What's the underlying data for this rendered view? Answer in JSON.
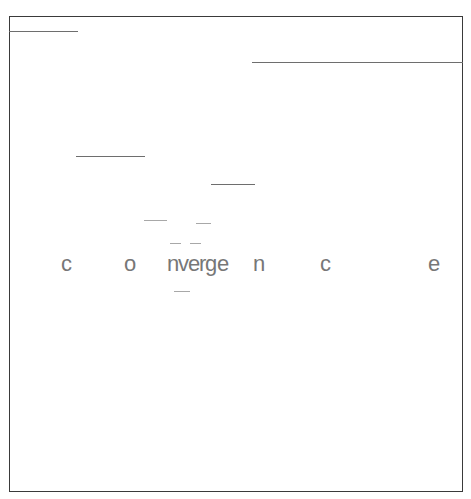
{
  "artwork": {
    "title": "convergence",
    "word": "convergence",
    "background_color": "#ffffff",
    "frame_color": "#3a3a3a",
    "line_color": "#8d8d8d",
    "text_color": "#777777"
  },
  "frame": {
    "label": "picture-frame-border",
    "x": 9,
    "y": 16,
    "width": 454,
    "height": 476
  },
  "lines": [
    {
      "label": "rule-1",
      "x": 9,
      "y": 31,
      "length": 69,
      "weight": "heavy"
    },
    {
      "label": "rule-2",
      "x": 252,
      "y": 62,
      "length": 211,
      "weight": "heavy"
    },
    {
      "label": "rule-3",
      "x": 76,
      "y": 156,
      "length": 69,
      "weight": "heavy"
    },
    {
      "label": "rule-4",
      "x": 211,
      "y": 184,
      "length": 44,
      "weight": "heavy"
    },
    {
      "label": "rule-5",
      "x": 144,
      "y": 220,
      "length": 23,
      "weight": "light"
    },
    {
      "label": "rule-6",
      "x": 196,
      "y": 223,
      "length": 15,
      "weight": "light"
    },
    {
      "label": "rule-7",
      "x": 170,
      "y": 243,
      "length": 11,
      "weight": "light"
    },
    {
      "label": "rule-8",
      "x": 190,
      "y": 243,
      "length": 11,
      "weight": "light"
    },
    {
      "label": "rule-9",
      "x": 174,
      "y": 291,
      "length": 16,
      "weight": "light"
    }
  ],
  "glyphs": [
    {
      "char": "c",
      "x": 61,
      "y": 253
    },
    {
      "char": "o",
      "x": 124,
      "y": 253
    },
    {
      "char": "n",
      "x": 167,
      "y": 253
    },
    {
      "char": "v",
      "x": 178,
      "y": 253
    },
    {
      "char": "e",
      "x": 188,
      "y": 253
    },
    {
      "char": "r",
      "x": 199,
      "y": 253
    },
    {
      "char": "g",
      "x": 205,
      "y": 253
    },
    {
      "char": "e",
      "x": 217,
      "y": 253
    },
    {
      "char": "n",
      "x": 253,
      "y": 253
    },
    {
      "char": "c",
      "x": 320,
      "y": 253
    },
    {
      "char": "e",
      "x": 428,
      "y": 253
    }
  ]
}
